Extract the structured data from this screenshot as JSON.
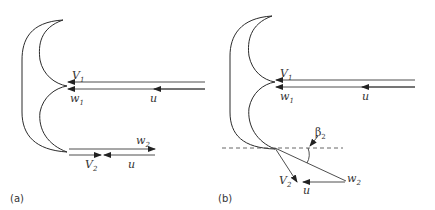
{
  "panels": [
    {
      "id": "a",
      "caption": "(a)",
      "labels": {
        "v1": "V",
        "v1_sub": "1",
        "w1": "w",
        "w1_sub": "1",
        "u_in": "u",
        "w2": "w",
        "w2_sub": "2",
        "v2": "V",
        "v2_sub": "2",
        "u_out": "u"
      }
    },
    {
      "id": "b",
      "caption": "(b)",
      "labels": {
        "v1": "V",
        "v1_sub": "1",
        "w1": "w",
        "w1_sub": "1",
        "u_in": "u",
        "beta": "β",
        "beta_sub": "2",
        "v2": "V",
        "v2_sub": "2",
        "u_out": "u",
        "w2": "w",
        "w2_sub": "2"
      }
    }
  ]
}
